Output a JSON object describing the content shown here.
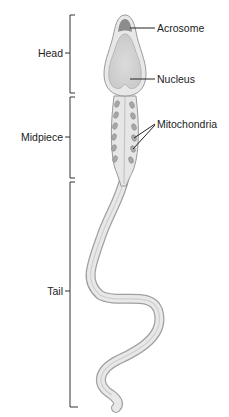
{
  "diagram": {
    "regions": [
      {
        "id": "head",
        "label": "Head"
      },
      {
        "id": "midpiece",
        "label": "Midpiece"
      },
      {
        "id": "tail",
        "label": "Tail"
      }
    ],
    "parts": [
      {
        "id": "acrosome",
        "label": "Acrosome"
      },
      {
        "id": "nucleus",
        "label": "Nucleus"
      },
      {
        "id": "mitochondria",
        "label": "Mitochondria"
      }
    ],
    "colors": {
      "outline": "#9a9a9a",
      "body_fill": "#e6e6e6",
      "nucleus_fill": "#d4d4d4",
      "acrosome_fill": "#8c8c8c",
      "mitochondria_fill": "#a8a8a8",
      "bracket": "#333333",
      "text": "#222222"
    }
  }
}
